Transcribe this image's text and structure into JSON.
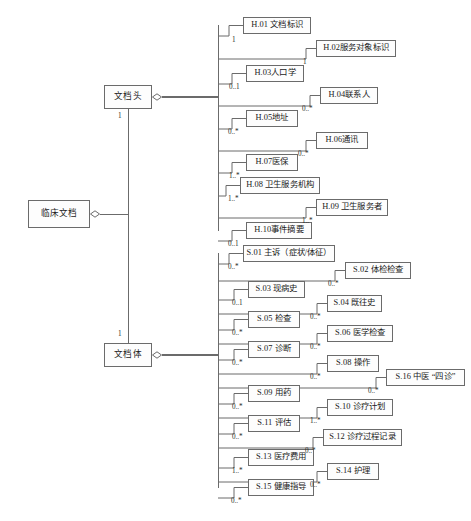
{
  "diagram": {
    "type": "uml-composition-diagram",
    "title": "",
    "line_color": "#6b6b6b",
    "box_fill": "#fdfdfd",
    "text_color": "#1b1b1b"
  },
  "roots": [
    {
      "id": "clinical-document",
      "label": "临床文档",
      "x": 28,
      "y": 200,
      "w": 62,
      "h": 28
    }
  ],
  "branches": [
    {
      "id": "document-header",
      "label": "文档头",
      "x": 104,
      "y": 85,
      "w": 48,
      "h": 24,
      "multiplicity": "1",
      "mult_x": 118,
      "mult_y": 112
    },
    {
      "id": "document-body",
      "label": "文档体",
      "x": 104,
      "y": 343,
      "w": 48,
      "h": 24,
      "multiplicity": "1",
      "mult_x": 118,
      "mult_y": 330
    }
  ],
  "header_children": [
    {
      "id": "H.01",
      "label": "H.01 文档标识",
      "multiplicity": "1",
      "x": 243,
      "y": 17,
      "w": 68,
      "h": 17,
      "mult_x": 232,
      "mult_y": 36
    },
    {
      "id": "H.02",
      "label": "H.02服务对象标识",
      "multiplicity": "1",
      "x": 316,
      "y": 40,
      "w": 80,
      "h": 17,
      "mult_x": 303,
      "mult_y": 58
    },
    {
      "id": "H.03",
      "label": "H.03人口学",
      "multiplicity": "0..1",
      "x": 246,
      "y": 65,
      "w": 58,
      "h": 17,
      "mult_x": 229,
      "mult_y": 83
    },
    {
      "id": "H.04",
      "label": "H.04联系人",
      "multiplicity": "0..*",
      "x": 320,
      "y": 87,
      "w": 58,
      "h": 17,
      "mult_x": 302,
      "mult_y": 105
    },
    {
      "id": "H.05",
      "label": "H.05地址",
      "multiplicity": "0..*",
      "x": 246,
      "y": 110,
      "w": 52,
      "h": 17,
      "mult_x": 228,
      "mult_y": 128
    },
    {
      "id": "H.06",
      "label": "H.06通讯",
      "multiplicity": "0..*",
      "x": 316,
      "y": 132,
      "w": 52,
      "h": 17,
      "mult_x": 298,
      "mult_y": 150
    },
    {
      "id": "H.07",
      "label": "H.07医保",
      "multiplicity": "1..*",
      "x": 246,
      "y": 154,
      "w": 52,
      "h": 17,
      "mult_x": 229,
      "mult_y": 172
    },
    {
      "id": "H.08",
      "label": "H.08 卫生服务机构",
      "multiplicity": "1..*",
      "x": 240,
      "y": 177,
      "w": 80,
      "h": 17,
      "mult_x": 228,
      "mult_y": 195
    },
    {
      "id": "H.09",
      "label": "H.09 卫生服务者",
      "multiplicity": "1..*",
      "x": 316,
      "y": 199,
      "w": 72,
      "h": 17,
      "mult_x": 302,
      "mult_y": 217
    },
    {
      "id": "H.10",
      "label": "H.10事件摘要",
      "multiplicity": "0..1",
      "x": 246,
      "y": 222,
      "w": 66,
      "h": 17,
      "mult_x": 228,
      "mult_y": 240
    }
  ],
  "body_children": [
    {
      "id": "S.01",
      "label": "S.01 主诉（症状/体征）",
      "multiplicity": "0..*",
      "x": 243,
      "y": 245,
      "w": 92,
      "h": 17,
      "mult_x": 228,
      "mult_y": 263
    },
    {
      "id": "S.02",
      "label": "S.02 体检检查",
      "multiplicity": "0..*",
      "x": 345,
      "y": 262,
      "w": 66,
      "h": 17,
      "mult_x": 328,
      "mult_y": 280
    },
    {
      "id": "S.03",
      "label": "S.03 现病史",
      "multiplicity": "0..1",
      "x": 248,
      "y": 281,
      "w": 57,
      "h": 17,
      "mult_x": 232,
      "mult_y": 299
    },
    {
      "id": "S.04",
      "label": "S.04 既往史",
      "multiplicity": "0..*",
      "x": 327,
      "y": 295,
      "w": 55,
      "h": 17,
      "mult_x": 310,
      "mult_y": 313
    },
    {
      "id": "S.05",
      "label": "S.05 检查",
      "multiplicity": "0..*",
      "x": 248,
      "y": 311,
      "w": 52,
      "h": 17,
      "mult_x": 232,
      "mult_y": 329
    },
    {
      "id": "S.06",
      "label": "S.06 医学检查",
      "multiplicity": "0..*",
      "x": 327,
      "y": 325,
      "w": 66,
      "h": 17,
      "mult_x": 310,
      "mult_y": 343
    },
    {
      "id": "S.07",
      "label": "S.07 诊断",
      "multiplicity": "0..*",
      "x": 248,
      "y": 341,
      "w": 52,
      "h": 17,
      "mult_x": 232,
      "mult_y": 359
    },
    {
      "id": "S.08",
      "label": "S.08 操作",
      "multiplicity": "0..*",
      "x": 327,
      "y": 355,
      "w": 52,
      "h": 17,
      "mult_x": 310,
      "mult_y": 373
    },
    {
      "id": "S.16",
      "label": "S.16 中医 “四诊”",
      "multiplicity": "0..*",
      "x": 386,
      "y": 369,
      "w": 79,
      "h": 17,
      "mult_x": 368,
      "mult_y": 387
    },
    {
      "id": "S.09",
      "label": "S.09 用药",
      "multiplicity": "0..*",
      "x": 248,
      "y": 385,
      "w": 52,
      "h": 17,
      "mult_x": 232,
      "mult_y": 403
    },
    {
      "id": "S.10",
      "label": "S.10 诊疗计划",
      "multiplicity": "1..*",
      "x": 327,
      "y": 399,
      "w": 66,
      "h": 17,
      "mult_x": 310,
      "mult_y": 417
    },
    {
      "id": "S.11",
      "label": "S.11 评估",
      "multiplicity": "0..*",
      "x": 248,
      "y": 415,
      "w": 52,
      "h": 17,
      "mult_x": 232,
      "mult_y": 433
    },
    {
      "id": "S.12",
      "label": "S.12 诊疗过程记录",
      "multiplicity": "0..*",
      "x": 323,
      "y": 429,
      "w": 79,
      "h": 17,
      "mult_x": 305,
      "mult_y": 447
    },
    {
      "id": "S.13",
      "label": "S.13 医疗费用",
      "multiplicity": "1..*",
      "x": 248,
      "y": 449,
      "w": 66,
      "h": 17,
      "mult_x": 232,
      "mult_y": 467
    },
    {
      "id": "S.14",
      "label": "S.14 护理",
      "multiplicity": "0..*",
      "x": 327,
      "y": 463,
      "w": 52,
      "h": 17,
      "mult_x": 310,
      "mult_y": 481
    },
    {
      "id": "S.15",
      "label": "S.15 健康指导",
      "multiplicity": "0..*",
      "x": 248,
      "y": 479,
      "w": 66,
      "h": 17,
      "mult_x": 231,
      "mult_y": 497
    }
  ],
  "geometry": {
    "root_trunk_x": 128,
    "header_fan_x": 218,
    "body_fan_x": 218,
    "header_anchor_y": 97,
    "body_anchor_y": 355,
    "clinical_anchor_y": 214,
    "header_fan_top": 25,
    "header_fan_bottom": 231,
    "body_fan_top": 253,
    "body_fan_bottom": 488
  }
}
